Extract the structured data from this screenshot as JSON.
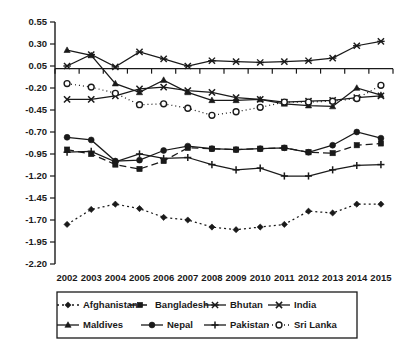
{
  "chart_data": {
    "type": "line",
    "title": "",
    "subtitle": "",
    "xlabel": "",
    "ylabel": "",
    "grid": false,
    "legend_position": "bottom",
    "x": [
      2002,
      2003,
      2004,
      2005,
      2006,
      2007,
      2008,
      2009,
      2010,
      2011,
      2012,
      2013,
      2014,
      2015
    ],
    "categories": [
      "2002",
      "2003",
      "2004",
      "2005",
      "2006",
      "2007",
      "2008",
      "2009",
      "2010",
      "2011",
      "2012",
      "2013",
      "2014",
      "2015"
    ],
    "ylim": [
      -2.2,
      0.55
    ],
    "yticks": [
      0.55,
      0.3,
      0.05,
      -0.2,
      -0.45,
      -0.7,
      -0.95,
      -1.2,
      -1.45,
      -1.7,
      -1.95,
      -2.2
    ],
    "ytick_labels": [
      "0.55",
      "0.30",
      "0.05",
      "-0.20",
      "-0.45",
      "-0.70",
      "-0.95",
      "-1.20",
      "-1.45",
      "-1.70",
      "-1.95",
      "-2.20"
    ],
    "series": [
      {
        "name": "Afghanistan",
        "marker": "diamond",
        "dash": "2,3",
        "values": [
          -1.75,
          -1.58,
          -1.52,
          -1.57,
          -1.67,
          -1.7,
          -1.78,
          -1.81,
          -1.78,
          -1.75,
          -1.6,
          -1.62,
          -1.52,
          -1.52
        ]
      },
      {
        "name": "Bangladesh",
        "marker": "square",
        "dash": "7,4",
        "values": [
          -0.9,
          -0.95,
          -1.07,
          -1.12,
          -1.03,
          -0.88,
          -0.89,
          -0.9,
          -0.89,
          -0.88,
          -0.93,
          -0.94,
          -0.85,
          -0.83
        ]
      },
      {
        "name": "Bhutan",
        "marker": "star",
        "dash": "none",
        "values": [
          0.05,
          0.18,
          0.04,
          0.21,
          0.13,
          0.05,
          0.11,
          0.1,
          0.09,
          0.1,
          0.11,
          0.14,
          0.28,
          0.33
        ]
      },
      {
        "name": "India",
        "marker": "x",
        "dash": "none",
        "values": [
          -0.33,
          -0.33,
          -0.29,
          -0.21,
          -0.19,
          -0.23,
          -0.25,
          -0.31,
          -0.33,
          -0.36,
          -0.35,
          -0.34,
          -0.31,
          -0.29
        ]
      },
      {
        "name": "Maldives",
        "marker": "triangle",
        "dash": "none",
        "values": [
          0.23,
          0.17,
          -0.15,
          -0.25,
          -0.11,
          -0.25,
          -0.34,
          -0.34,
          -0.33,
          -0.38,
          -0.4,
          -0.41,
          -0.2,
          -0.28
        ]
      },
      {
        "name": "Nepal",
        "marker": "circle-filled",
        "dash": "none",
        "values": [
          -0.76,
          -0.79,
          -1.03,
          -1.02,
          -0.91,
          -0.86,
          -0.89,
          -0.9,
          -0.89,
          -0.88,
          -0.93,
          -0.85,
          -0.7,
          -0.77
        ]
      },
      {
        "name": "Pakistan",
        "marker": "plus",
        "dash": "none",
        "values": [
          -0.93,
          -0.92,
          -1.04,
          -0.95,
          -1.0,
          -0.99,
          -1.07,
          -1.13,
          -1.11,
          -1.2,
          -1.2,
          -1.13,
          -1.08,
          -1.07
        ]
      },
      {
        "name": "Sri Lanka",
        "marker": "circle-open",
        "dash": "1,3",
        "values": [
          -0.15,
          -0.19,
          -0.26,
          -0.39,
          -0.38,
          -0.43,
          -0.51,
          -0.47,
          -0.42,
          -0.36,
          -0.36,
          -0.35,
          -0.32,
          -0.17
        ]
      }
    ]
  },
  "legend": {
    "entries": [
      {
        "label": "Afghanistan"
      },
      {
        "label": "Bangladesh"
      },
      {
        "label": "Bhutan"
      },
      {
        "label": "India"
      },
      {
        "label": "Maldives"
      },
      {
        "label": "Nepal"
      },
      {
        "label": "Pakistan"
      },
      {
        "label": "Sri Lanka"
      }
    ]
  },
  "colors": {
    "ink": "#1a1a1a",
    "background": "#ffffff"
  }
}
